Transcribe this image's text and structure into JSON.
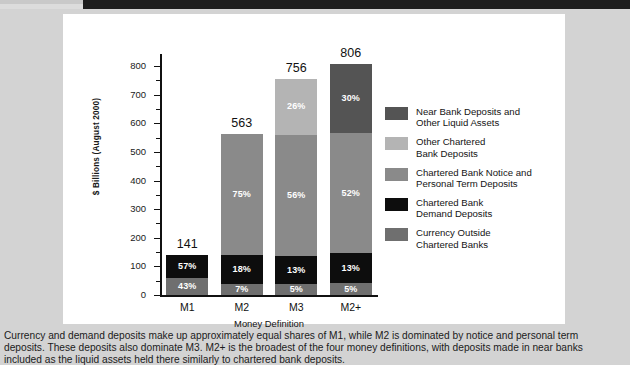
{
  "header": {
    "bar_color": "#1d1d1d"
  },
  "panel": {
    "background": "#ffffff"
  },
  "chart_data": {
    "type": "bar",
    "subtype": "stacked-bar",
    "title": "",
    "xlabel": "Money Definition",
    "ylabel": "$ Billions  (August 2000)",
    "ylim": [
      0,
      800
    ],
    "ytick_values": [
      0,
      100,
      200,
      300,
      400,
      500,
      600,
      700,
      800
    ],
    "ytick_labels": [
      "0",
      "100",
      "200",
      "300",
      "400",
      "500",
      "600",
      "700",
      "800"
    ],
    "yminor_values": [
      50,
      150,
      250,
      350,
      450,
      550,
      650,
      750
    ],
    "grid": false,
    "legend_position": "right",
    "categories": [
      "M1",
      "M2",
      "M3",
      "M2+"
    ],
    "totals": [
      141,
      563,
      756,
      806
    ],
    "total_labels": [
      "141",
      "563",
      "756",
      "806"
    ],
    "series": [
      {
        "name": "Currency Outside\nChartered Banks",
        "color": "#6f6f6f",
        "values": [
          43,
          7,
          5,
          5
        ],
        "value_labels": [
          "43%",
          "7%",
          "5%",
          "5%"
        ]
      },
      {
        "name": "Chartered Bank\nDemand Deposits",
        "color": "#0d0d0d",
        "values": [
          57,
          18,
          13,
          13
        ],
        "value_labels": [
          "57%",
          "18%",
          "13%",
          "13%"
        ]
      },
      {
        "name": "Chartered Bank Notice and\nPersonal Term Deposits",
        "color": "#8a8a8a",
        "values": [
          0,
          75,
          56,
          52
        ],
        "value_labels": [
          "",
          "75%",
          "56%",
          "52%"
        ]
      },
      {
        "name": "Other Chartered\nBank Deposits",
        "color": "#b4b4b4",
        "values": [
          0,
          0,
          26,
          0
        ],
        "value_labels": [
          "",
          "",
          "26%",
          ""
        ]
      },
      {
        "name": "Near Bank Deposits and\nOther Liquid Assets",
        "color": "#545454",
        "values": [
          0,
          0,
          0,
          30
        ],
        "value_labels": [
          "",
          "",
          "",
          "30%"
        ]
      }
    ],
    "legend_entries": [
      {
        "label": "Near Bank Deposits and\nOther Liquid Assets",
        "color": "#545454"
      },
      {
        "label": "Other Chartered\nBank Deposits",
        "color": "#b4b4b4"
      },
      {
        "label": "Chartered Bank Notice and\nPersonal Term Deposits",
        "color": "#8a8a8a"
      },
      {
        "label": "Chartered Bank\nDemand Deposits",
        "color": "#0d0d0d"
      },
      {
        "label": "Currency Outside\nChartered Banks",
        "color": "#6f6f6f"
      }
    ]
  },
  "caption": {
    "line1": "Currency and demand deposits make up approximately equal shares of M1, while M2 is dominated by notice and personal term",
    "line2": "deposits. These deposits also dominate M3. M2+ is the broadest of the four money definitions, with deposits made in near banks",
    "line3": "included as the liquid assets held there similarly to chartered bank deposits."
  }
}
